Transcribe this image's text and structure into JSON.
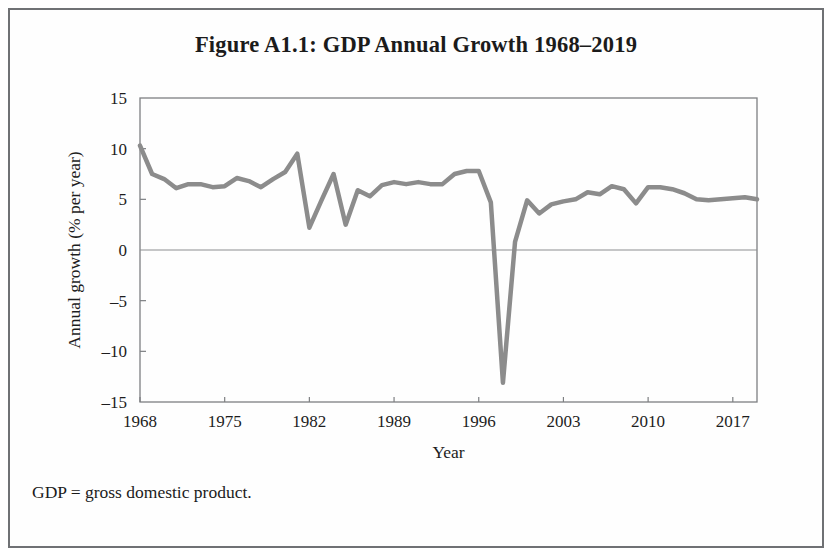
{
  "figure": {
    "title": "Figure A1.1: GDP Annual Growth 1968–2019",
    "note": "GDP = gross domestic product."
  },
  "chart_data": {
    "type": "line",
    "title": "Figure A1.1: GDP Annual Growth 1968–2019",
    "xlabel": "Year",
    "ylabel": "Annual growth (% per year)",
    "xlim": [
      1968,
      2019
    ],
    "ylim": [
      -15,
      15
    ],
    "xticks": [
      1968,
      1975,
      1982,
      1989,
      1996,
      2003,
      2010,
      2017
    ],
    "xtick_labels": [
      "1968",
      "1975",
      "1982",
      "1989",
      "1996",
      "2003",
      "2010",
      "2017"
    ],
    "yticks": [
      15,
      10,
      5,
      0,
      -5,
      -10,
      -15
    ],
    "ytick_labels": [
      "15",
      "10",
      "5",
      "0",
      "–5",
      "–10",
      "–15"
    ],
    "grid": false,
    "legend": false,
    "line_color": "#8c8c8c",
    "line_width": 4.5,
    "zero_line": true,
    "x": [
      1968,
      1969,
      1970,
      1971,
      1972,
      1973,
      1974,
      1975,
      1976,
      1977,
      1978,
      1979,
      1980,
      1981,
      1982,
      1983,
      1984,
      1985,
      1986,
      1987,
      1988,
      1989,
      1990,
      1991,
      1992,
      1993,
      1994,
      1995,
      1996,
      1997,
      1998,
      1999,
      2000,
      2001,
      2002,
      2003,
      2004,
      2005,
      2006,
      2007,
      2008,
      2009,
      2010,
      2011,
      2012,
      2013,
      2014,
      2015,
      2016,
      2017,
      2018,
      2019
    ],
    "values": [
      10.3,
      7.5,
      7.0,
      6.1,
      6.5,
      6.5,
      6.2,
      6.3,
      7.1,
      6.8,
      6.2,
      7.0,
      7.7,
      9.5,
      2.2,
      4.9,
      7.5,
      2.5,
      5.9,
      5.3,
      6.4,
      6.7,
      6.5,
      6.7,
      6.5,
      6.5,
      7.5,
      7.8,
      7.8,
      4.7,
      -13.1,
      0.8,
      4.9,
      3.6,
      4.5,
      4.8,
      5.0,
      5.7,
      5.5,
      6.3,
      6.0,
      4.6,
      6.2,
      6.2,
      6.0,
      5.6,
      5.0,
      4.9,
      5.0,
      5.1,
      5.2,
      5.0
    ]
  }
}
